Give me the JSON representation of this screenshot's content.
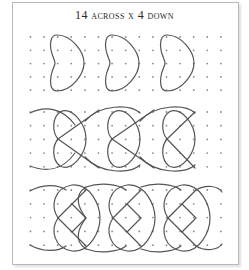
{
  "figure": {
    "title": "14 across x 4 down",
    "colors": {
      "frame": "#b9b9b9",
      "dots": "#8a8a8a",
      "lines": "#555555",
      "background": "#ffffff"
    },
    "sections": [
      {
        "name": "row-1-hearts",
        "description": "Three separate heart shapes pointing right on a dot grid",
        "dot_rows": 5,
        "dot_columns": 15,
        "motif_count": 3
      },
      {
        "name": "row-2-linked-hearts",
        "description": "Chain of hearts linked by crossing X strokes and outer arcs",
        "dot_rows": 5,
        "dot_columns": 15,
        "motif_count": 3
      },
      {
        "name": "row-3-interlaced-loops",
        "description": "Interlaced circular loops with crossing strokes forming a continuous band",
        "dot_rows": 5,
        "dot_columns": 15,
        "motif_count": 3
      }
    ]
  }
}
